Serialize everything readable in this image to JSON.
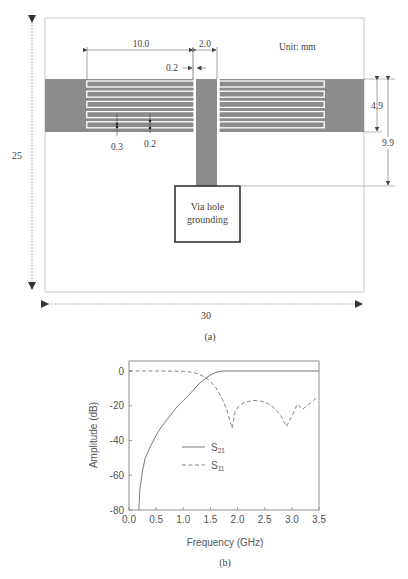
{
  "figure_a": {
    "caption": "(a)",
    "unit_label": "Unit: mm",
    "board_width_label": "30",
    "board_height_label": "25",
    "dims": {
      "finger_length": "10.0",
      "stub_width": "2.0",
      "gap_stub": "0.2",
      "slot_width": "0.3",
      "line_width": "0.2",
      "band_height": "4.9",
      "stub_length": "9.9"
    },
    "via_label_line1": "Via hole",
    "via_label_line2": "grounding",
    "colors": {
      "metal": "#8c8c8c",
      "board_outline": "#bbbbbb",
      "via_border": "#333333"
    }
  },
  "figure_b": {
    "caption": "(b)",
    "legend": [
      {
        "label": "S",
        "sub": "21",
        "style": "solid"
      },
      {
        "label": "S",
        "sub": "11",
        "style": "dashed"
      }
    ]
  },
  "chart_data": {
    "type": "line",
    "title": "",
    "xlabel": "Frequency (GHz)",
    "ylabel": "Amplitude (dB)",
    "xlim": [
      0.0,
      3.5
    ],
    "ylim": [
      -80,
      5
    ],
    "xticks": [
      "0.0",
      "0.5",
      "1.0",
      "1.5",
      "2.0",
      "2.5",
      "3.0",
      "3.5"
    ],
    "yticks": [
      "0",
      "-20",
      "-40",
      "-60",
      "-80"
    ],
    "grid": false,
    "legend_position": "center",
    "series": [
      {
        "name": "S21",
        "style": "solid",
        "x": [
          0.18,
          0.2,
          0.25,
          0.3,
          0.4,
          0.5,
          0.6,
          0.7,
          0.8,
          0.9,
          1.0,
          1.1,
          1.2,
          1.3,
          1.4,
          1.5,
          1.6,
          1.7,
          1.8,
          2.0,
          2.5,
          3.0,
          3.5
        ],
        "values": [
          -80,
          -68,
          -57,
          -50,
          -43,
          -37,
          -32,
          -28,
          -24,
          -20,
          -17,
          -14,
          -10.5,
          -7,
          -4.5,
          -2.3,
          -0.8,
          -0.1,
          0,
          0,
          0,
          0,
          0
        ]
      },
      {
        "name": "S11",
        "style": "dashed",
        "x": [
          0.0,
          0.5,
          1.0,
          1.1,
          1.2,
          1.3,
          1.4,
          1.5,
          1.6,
          1.7,
          1.8,
          1.9,
          1.95,
          2.0,
          2.1,
          2.2,
          2.3,
          2.4,
          2.5,
          2.6,
          2.7,
          2.8,
          2.9,
          2.95,
          3.0,
          3.1,
          3.2,
          3.3,
          3.4,
          3.45
        ],
        "values": [
          0,
          0,
          -0.2,
          -0.5,
          -1,
          -2,
          -3.5,
          -6,
          -9.5,
          -15,
          -22,
          -33,
          -24,
          -21,
          -18.5,
          -17.5,
          -17,
          -17.2,
          -18,
          -19.5,
          -22,
          -26,
          -32,
          -29,
          -26,
          -19,
          -22,
          -19.5,
          -17,
          -15
        ]
      }
    ]
  }
}
